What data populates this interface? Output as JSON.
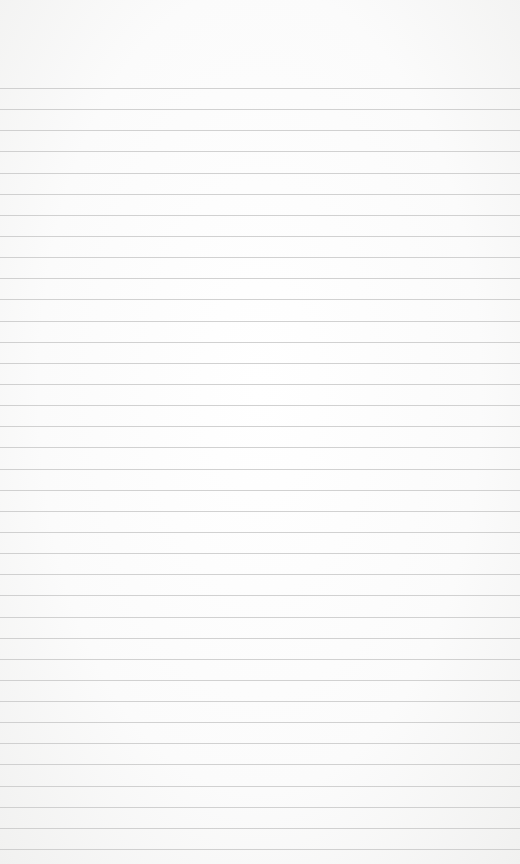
{
  "page": {
    "type": "lined-paper",
    "background_color": "#fbfbfb",
    "line_color": "#c9c9c9",
    "first_line_y": 88,
    "line_spacing": 21.14,
    "line_count": 37
  }
}
